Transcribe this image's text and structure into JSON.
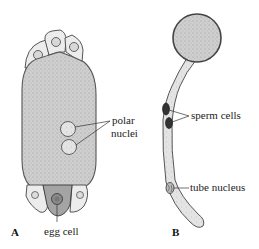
{
  "figure": {
    "panel_a": {
      "letter": "A",
      "labels": {
        "polar_line1": "polar",
        "polar_line2": "nuclei",
        "egg_cell": "egg cell"
      }
    },
    "panel_b": {
      "letter": "B",
      "labels": {
        "sperm_cells": "sperm cells",
        "tube_nucleus": "tube nucleus"
      }
    }
  },
  "colors": {
    "fill_stipple": "#c9c9c9",
    "fill_light": "#ececec",
    "outline": "#555555",
    "egg_fill": "#9a9a9a",
    "sperm_fill": "#333333"
  }
}
